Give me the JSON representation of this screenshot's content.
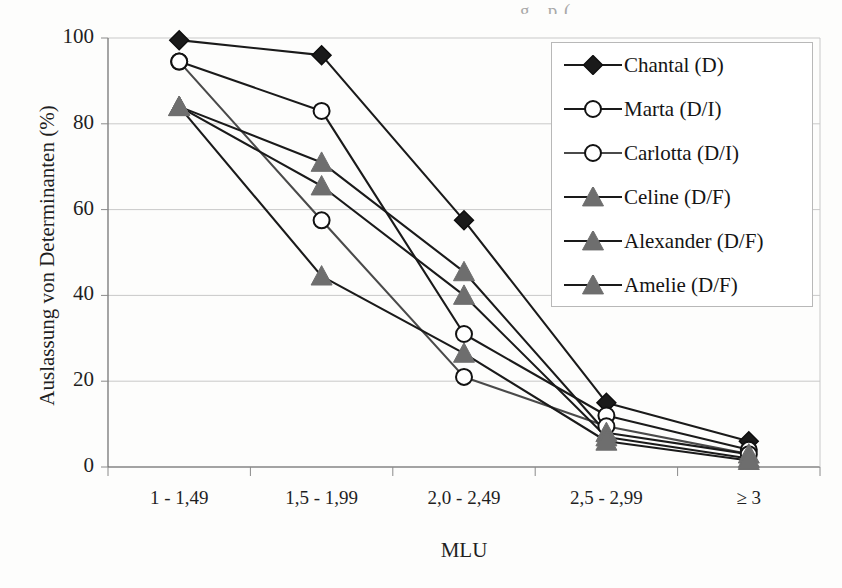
{
  "page_bleed_text": "g   ,     p     (",
  "chart_data": {
    "type": "line",
    "title": "",
    "xlabel": "MLU",
    "ylabel": "Auslassung von Determinanten (%)",
    "categories": [
      "1 - 1,49",
      "1,5 - 1,99",
      "2,0 - 2,49",
      "2,5 - 2,99",
      "≥ 3"
    ],
    "ylim": [
      0,
      100
    ],
    "yticks": [
      0,
      20,
      40,
      60,
      80,
      100
    ],
    "ytick_labels": [
      "0",
      "20",
      "40",
      "60",
      "80",
      "100"
    ],
    "grid": true,
    "legend_position": "upper right",
    "series": [
      {
        "name": "Chantal (D)",
        "marker": "filled-diamond",
        "color": "#1a1a1a",
        "line_color": "#1a1a1a",
        "values": [
          99.5,
          96,
          57.5,
          15,
          6
        ]
      },
      {
        "name": "Marta (D/I)",
        "marker": "open-circle",
        "color": "#ffffff",
        "line_color": "#1a1a1a",
        "values": [
          94.5,
          83,
          31,
          12,
          4
        ]
      },
      {
        "name": "Carlotta (D/I)",
        "marker": "open-circle",
        "color": "#ffffff",
        "line_color": "#4a4a4a",
        "values": [
          94.5,
          57.5,
          21,
          9.5,
          3
        ]
      },
      {
        "name": "Celine (D/F)",
        "marker": "filled-triangle",
        "color": "#6e6e6e",
        "line_color": "#1a1a1a",
        "values": [
          84,
          71,
          45.5,
          8,
          3
        ]
      },
      {
        "name": "Alexander (D/F)",
        "marker": "filled-triangle",
        "color": "#6e6e6e",
        "line_color": "#1a1a1a",
        "values": [
          84,
          65.5,
          40,
          7,
          2
        ]
      },
      {
        "name": "Amelie (D/F)",
        "marker": "filled-triangle",
        "color": "#6e6e6e",
        "line_color": "#1a1a1a",
        "values": [
          84,
          44.5,
          26.5,
          6,
          1.5
        ]
      }
    ]
  }
}
